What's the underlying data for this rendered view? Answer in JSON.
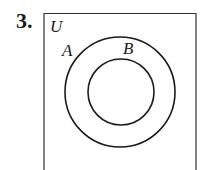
{
  "problem": {
    "number": "3."
  },
  "diagram": {
    "type": "venn",
    "universe_label": "U",
    "sets": [
      {
        "label": "A",
        "role": "outer"
      },
      {
        "label": "B",
        "role": "inner",
        "subset_of": "A"
      }
    ],
    "colors": {
      "stroke": "#1a1a1a",
      "background": "#ffffff"
    }
  }
}
